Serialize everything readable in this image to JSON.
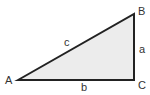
{
  "diagram": {
    "type": "right-triangle",
    "fill_color": "#ececec",
    "stroke_color": "#222222",
    "vertices": {
      "A": {
        "label": "A",
        "x": 18,
        "y": 80
      },
      "B": {
        "label": "B",
        "x": 134,
        "y": 14
      },
      "C": {
        "label": "C",
        "x": 134,
        "y": 80
      }
    },
    "sides": {
      "a": {
        "label": "a",
        "between": "B-C"
      },
      "b": {
        "label": "b",
        "between": "A-C"
      },
      "c": {
        "label": "c",
        "between": "A-B"
      }
    },
    "right_angle_at": "C"
  }
}
